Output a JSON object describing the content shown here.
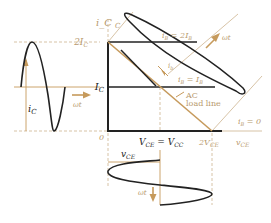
{
  "colors": {
    "ink": "#222222",
    "accent": "#c69a5c",
    "guide": "#cdb48f",
    "label_tan": "#b89a6e"
  },
  "axes": {
    "y_label": "i_C",
    "x_label": "v_CE",
    "origin_label": "0",
    "y_ticks": [
      {
        "main": "2I",
        "sub": "C"
      },
      {
        "main": "I",
        "sub": "C"
      }
    ],
    "x_ticks": [
      {
        "main": "V",
        "sub": "CE",
        "eq": " = V",
        "sub2": "CC"
      },
      {
        "main": "2V",
        "sub": "CE"
      }
    ]
  },
  "curves": {
    "ib_2": {
      "main": "i",
      "sub": "B",
      "eq": " = 2I",
      "sub2": "B"
    },
    "ib_1": {
      "main": "i",
      "sub": "B",
      "eq": " = I",
      "sub2": "B"
    },
    "ib_0": {
      "main": "i",
      "sub": "B",
      "eq": " = 0"
    }
  },
  "load_line": {
    "line1": "AC",
    "line2": "load line"
  },
  "waveforms": {
    "ic_wave_label": {
      "main": "i",
      "sub": "C"
    },
    "ic_time_label": "ωt",
    "vce_wave_label": {
      "main": "v",
      "sub": "CE"
    },
    "vce_time_label": "ωt",
    "ib_wave_label": {
      "main": "i",
      "sub": "b"
    },
    "ib_time_label": "ωt"
  }
}
